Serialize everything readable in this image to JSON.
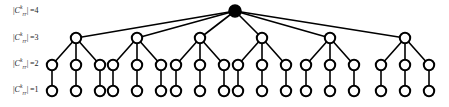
{
  "figure": {
    "background_color": "#ffffff",
    "stroke_color": "#000000",
    "node_fill_color": "#ffffff",
    "root_fill_color": "#000000",
    "width": 449,
    "height": 107
  },
  "row_labels": [
    {
      "id": "label-level-4",
      "symbol": "C",
      "superscript": "k",
      "subscript": "rr",
      "relation": "=",
      "value": "4",
      "full_text": "|C^k_rr| =4",
      "y": 7
    },
    {
      "id": "label-level-3",
      "symbol": "C",
      "superscript": "k",
      "subscript": "rr",
      "relation": "=",
      "value": "3",
      "full_text": "|C^k_rr| =3",
      "y": 34
    },
    {
      "id": "label-level-2",
      "symbol": "C",
      "superscript": "k",
      "subscript": "rr",
      "relation": "=",
      "value": "2",
      "full_text": "|C^k_rr| =2",
      "y": 60
    },
    {
      "id": "label-level-1",
      "symbol": "C",
      "superscript": "k",
      "subscript": "rr",
      "relation": "=",
      "value": "1",
      "full_text": "|C^k_rr| =1",
      "y": 86
    }
  ],
  "tree": {
    "levels": [
      {
        "name": "level-4-root",
        "cardinality": 4,
        "y": 11,
        "node_radius": 6,
        "filled": true,
        "nodes": [
          {
            "id": "n4-1",
            "x": 235
          }
        ]
      },
      {
        "name": "level-3-branch",
        "cardinality": 3,
        "y": 38,
        "node_radius": 5.2,
        "filled": false,
        "nodes": [
          {
            "id": "n3-1",
            "x": 76,
            "parent": "n4-1"
          },
          {
            "id": "n3-2",
            "x": 137,
            "parent": "n4-1"
          },
          {
            "id": "n3-3",
            "x": 200,
            "parent": "n4-1"
          },
          {
            "id": "n3-4",
            "x": 262,
            "parent": "n4-1"
          },
          {
            "id": "n3-5",
            "x": 330,
            "parent": "n4-1"
          },
          {
            "id": "n3-6",
            "x": 405,
            "parent": "n4-1"
          }
        ]
      },
      {
        "name": "level-2-sub",
        "cardinality": 2,
        "y": 65,
        "node_radius": 5.2,
        "filled": false,
        "nodes": [
          {
            "id": "n2-1",
            "x": 52,
            "parent": "n3-1"
          },
          {
            "id": "n2-2",
            "x": 76,
            "parent": "n3-1"
          },
          {
            "id": "n2-3",
            "x": 100,
            "parent": "n3-1"
          },
          {
            "id": "n2-4",
            "x": 113,
            "parent": "n3-2"
          },
          {
            "id": "n2-5",
            "x": 137,
            "parent": "n3-2"
          },
          {
            "id": "n2-6",
            "x": 161,
            "parent": "n3-2"
          },
          {
            "id": "n2-7",
            "x": 176,
            "parent": "n3-3"
          },
          {
            "id": "n2-8",
            "x": 200,
            "parent": "n3-3"
          },
          {
            "id": "n2-9",
            "x": 224,
            "parent": "n3-3"
          },
          {
            "id": "n2-10",
            "x": 238,
            "parent": "n3-4"
          },
          {
            "id": "n2-11",
            "x": 262,
            "parent": "n3-4"
          },
          {
            "id": "n2-12",
            "x": 286,
            "parent": "n3-4"
          },
          {
            "id": "n2-13",
            "x": 306,
            "parent": "n3-5"
          },
          {
            "id": "n2-14",
            "x": 330,
            "parent": "n3-5"
          },
          {
            "id": "n2-15",
            "x": 354,
            "parent": "n3-5"
          },
          {
            "id": "n2-16",
            "x": 381,
            "parent": "n3-6"
          },
          {
            "id": "n2-17",
            "x": 405,
            "parent": "n3-6"
          },
          {
            "id": "n2-18",
            "x": 429,
            "parent": "n3-6"
          }
        ]
      },
      {
        "name": "level-1-leaf",
        "cardinality": 1,
        "y": 91,
        "node_radius": 5.2,
        "filled": false,
        "nodes": [
          {
            "id": "n1-1",
            "x": 52,
            "parent": "n2-1"
          },
          {
            "id": "n1-2",
            "x": 76,
            "parent": "n2-2"
          },
          {
            "id": "n1-3",
            "x": 100,
            "parent": "n2-3"
          },
          {
            "id": "n1-4",
            "x": 113,
            "parent": "n2-4"
          },
          {
            "id": "n1-5",
            "x": 137,
            "parent": "n2-5"
          },
          {
            "id": "n1-6",
            "x": 161,
            "parent": "n2-6"
          },
          {
            "id": "n1-7",
            "x": 176,
            "parent": "n2-7"
          },
          {
            "id": "n1-8",
            "x": 200,
            "parent": "n2-8"
          },
          {
            "id": "n1-9",
            "x": 224,
            "parent": "n2-9"
          },
          {
            "id": "n1-10",
            "x": 238,
            "parent": "n2-10"
          },
          {
            "id": "n1-11",
            "x": 262,
            "parent": "n2-11"
          },
          {
            "id": "n1-12",
            "x": 286,
            "parent": "n2-12"
          },
          {
            "id": "n1-13",
            "x": 306,
            "parent": "n2-13"
          },
          {
            "id": "n1-14",
            "x": 330,
            "parent": "n2-14"
          },
          {
            "id": "n1-15",
            "x": 354,
            "parent": "n2-15"
          },
          {
            "id": "n1-16",
            "x": 381,
            "parent": "n2-16"
          },
          {
            "id": "n1-17",
            "x": 405,
            "parent": "n2-17"
          },
          {
            "id": "n1-18",
            "x": 429,
            "parent": "n2-18"
          }
        ]
      }
    ]
  }
}
